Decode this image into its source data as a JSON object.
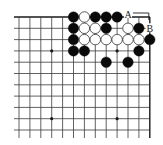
{
  "diagram": {
    "type": "go-board-fragment",
    "colors": {
      "background": "#ffffff",
      "grid_line": "#3a3a3a",
      "edge_line": "#1a1a1a",
      "black_stone": "#0a0a0a",
      "white_stone_fill": "#ffffff",
      "white_stone_stroke": "#333333",
      "label": "#222222"
    },
    "grid": {
      "columns": 13,
      "rows": 11,
      "origin_x": 19,
      "origin_y": 17,
      "spacing_x": 10.9,
      "spacing_y": 11.3,
      "left_extend": 5,
      "bottom_extend": 8,
      "top_edge": true,
      "right_edge": true,
      "left_edge": false,
      "bottom_edge": false
    },
    "star_points": [
      {
        "col": 3,
        "row": 3
      },
      {
        "col": 9,
        "row": 3
      },
      {
        "col": 3,
        "row": 9
      },
      {
        "col": 9,
        "row": 9
      }
    ],
    "stones": [
      {
        "col": 5,
        "row": 0,
        "color": "black"
      },
      {
        "col": 6,
        "row": 0,
        "color": "white"
      },
      {
        "col": 7,
        "row": 0,
        "color": "black"
      },
      {
        "col": 8,
        "row": 0,
        "color": "black"
      },
      {
        "col": 9,
        "row": 0,
        "color": "black"
      },
      {
        "col": 5,
        "row": 1,
        "color": "black"
      },
      {
        "col": 6,
        "row": 1,
        "color": "white"
      },
      {
        "col": 7,
        "row": 1,
        "color": "white"
      },
      {
        "col": 8,
        "row": 1,
        "color": "black"
      },
      {
        "col": 10,
        "row": 1,
        "color": "white"
      },
      {
        "col": 11,
        "row": 1,
        "color": "black"
      },
      {
        "col": 5,
        "row": 2,
        "color": "black"
      },
      {
        "col": 6,
        "row": 2,
        "color": "white"
      },
      {
        "col": 7,
        "row": 2,
        "color": "white"
      },
      {
        "col": 8,
        "row": 2,
        "color": "white"
      },
      {
        "col": 9,
        "row": 2,
        "color": "white"
      },
      {
        "col": 10,
        "row": 2,
        "color": "white"
      },
      {
        "col": 11,
        "row": 2,
        "color": "white"
      },
      {
        "col": 12,
        "row": 2,
        "color": "black"
      },
      {
        "col": 5,
        "row": 3,
        "color": "black"
      },
      {
        "col": 6,
        "row": 3,
        "color": "black"
      },
      {
        "col": 11,
        "row": 3,
        "color": "black"
      },
      {
        "col": 8,
        "row": 4,
        "color": "black"
      },
      {
        "col": 10,
        "row": 4,
        "color": "black"
      }
    ],
    "labels": [
      {
        "text": "A",
        "col": 10,
        "row": 0,
        "dx": 0,
        "dy": -3
      },
      {
        "text": "B",
        "col": 12,
        "row": 1,
        "dx": 0,
        "dy": 0
      }
    ],
    "bracket": {
      "description": "connector line from A to B",
      "from": {
        "col": 10,
        "row": 0,
        "dx": 5,
        "dy": -4
      },
      "corner": {
        "col": 12,
        "row": 0,
        "dx": -1,
        "dy": -4
      },
      "to": {
        "col": 12,
        "row": 0,
        "dx": -1,
        "dy": 3
      }
    }
  }
}
